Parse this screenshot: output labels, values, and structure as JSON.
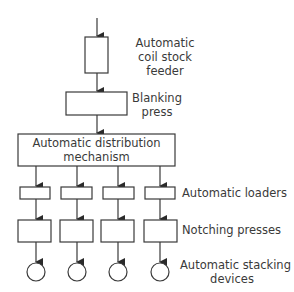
{
  "diagram": {
    "type": "flowchart",
    "stages": [
      {
        "id": "feeder",
        "label_lines": [
          "Automatic",
          "coil stock",
          "feeder"
        ],
        "count": 1
      },
      {
        "id": "blanking",
        "label_lines": [
          "Blanking",
          "press"
        ],
        "count": 1
      },
      {
        "id": "distribution",
        "label_lines": [
          "Automatic distribution",
          "mechanism"
        ],
        "count": 1
      },
      {
        "id": "loaders",
        "label_lines": [
          "Automatic loaders"
        ],
        "count": 4
      },
      {
        "id": "notching",
        "label_lines": [
          "Notching presses"
        ],
        "count": 4
      },
      {
        "id": "stacking",
        "label_lines": [
          "Automatic stacking",
          "devices"
        ],
        "count": 4,
        "shape": "circle"
      }
    ],
    "colors": {
      "line": "#3a3a3a",
      "fill": "#ffffff"
    }
  }
}
